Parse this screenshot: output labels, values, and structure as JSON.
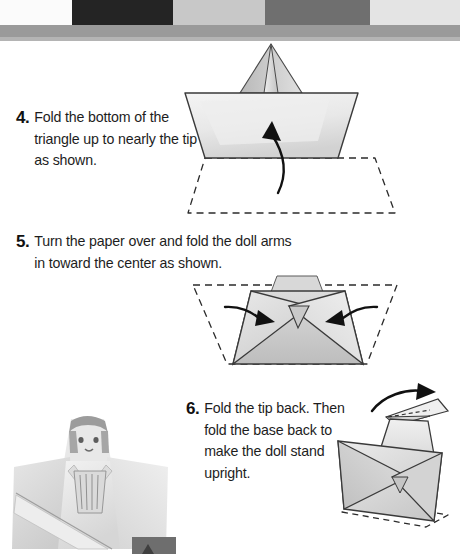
{
  "document": {
    "type": "scanned-instruction-page",
    "title": "Paper Doll Folding Instructions",
    "background_color": "#ffffff",
    "text_color": "#1d1d1d"
  },
  "scan_bar": {
    "name": "color-calibration-bar",
    "swatches": [
      {
        "label": "white",
        "color": "#fbfbfb",
        "width": 72
      },
      {
        "label": "black",
        "color": "#242424",
        "width": 101
      },
      {
        "label": "light-gray",
        "color": "#c8c8c8",
        "width": 92
      },
      {
        "label": "mid-gray",
        "color": "#6f6f6f",
        "width": 105
      },
      {
        "label": "near-white",
        "color": "#e4e4e4",
        "width": 90
      }
    ],
    "shadow_color": "#9a9a9a",
    "shadow2_color": "#b4b4b4"
  },
  "steps": [
    {
      "number": "4.",
      "text": "Fold the bottom of the triangle up to nearly the tip as shown.",
      "figure": {
        "name": "step-4-diagram",
        "description": "Trapezoid body with pointed triangle tip on top, curved up arrow, dashed trapezoid outline below",
        "arrow_direction": "up",
        "dashed_outline": true
      }
    },
    {
      "number": "5.",
      "text": "Turn the paper over and fold the doll arms in toward the center as shown.",
      "figure": {
        "name": "step-5-diagram",
        "description": "Trapezoid with crossed diagonal folds, two arrows pointing inward, dashed trapezoid outline",
        "arrow_direction": "inward",
        "dashed_outline": true
      }
    },
    {
      "number": "6.",
      "text": "Fold the tip back. Then fold the base back to make the doll stand upright.",
      "figure": {
        "name": "step-6-diagram",
        "description": "Standing doll form with tip folded back, curved arrow over the top, dashed base outline",
        "arrow_direction": "back-over-top",
        "dashed_outline": true
      }
    }
  ],
  "photo": {
    "name": "finished-paper-doll-photo",
    "description": "Photograph of the completed paper doll with a drawn face, hair, and kimono-style folded body"
  },
  "colors": {
    "paper_light": "#f2f2f2",
    "paper_mid": "#dcdcdc",
    "paper_shade": "#c4c4c4",
    "fold_line": "#3a3a3a",
    "dashed_line": "#2b2b2b",
    "arrow": "#111111"
  }
}
